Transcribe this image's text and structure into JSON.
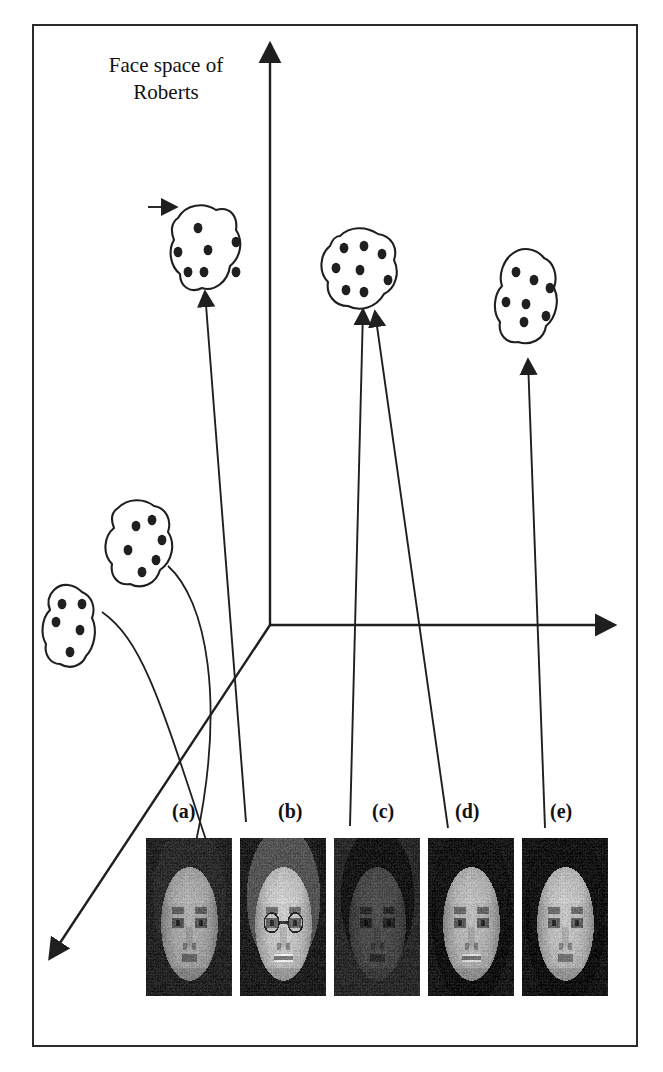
{
  "figure": {
    "title": "Face space of\nRoberts",
    "title_line1": "Face space of",
    "title_line2": "Roberts",
    "border_color": "#2a2a2a",
    "ink_color": "#1f1f1f",
    "background": "#ffffff"
  },
  "axes": {
    "origin": [
      270,
      625
    ],
    "items": [
      {
        "name": "vertical-axis",
        "from": [
          270,
          625
        ],
        "to": [
          270,
          44
        ],
        "arrow": "up"
      },
      {
        "name": "horizontal-axis",
        "from": [
          270,
          625
        ],
        "to": [
          614,
          625
        ],
        "arrow": "right"
      },
      {
        "name": "depth-axis",
        "from": [
          270,
          625
        ],
        "to": [
          50,
          958
        ],
        "arrow": "down-left"
      }
    ]
  },
  "clusters": [
    {
      "id": "cluster-1",
      "name": "cluster-top-left",
      "dots": 7,
      "cx": 198,
      "cy": 250,
      "path": "M178,218 C186,204 204,202 216,210 C230,206 238,216 236,230 C244,242 240,258 230,266 C228,282 214,292 202,288 C190,294 180,286 180,274 C170,266 168,250 174,240 C170,230 172,222 178,218 Z",
      "dot_positions": [
        [
          198,
          228
        ],
        [
          178,
          252
        ],
        [
          208,
          250
        ],
        [
          236,
          242
        ],
        [
          188,
          272
        ],
        [
          204,
          272
        ],
        [
          236,
          272
        ]
      ]
    },
    {
      "id": "cluster-2",
      "name": "cluster-top-middle",
      "dots": 8,
      "cx": 358,
      "cy": 283,
      "path": "M340,236 C350,226 366,226 378,234 C392,236 398,248 394,260 C400,272 396,288 384,294 C376,308 360,312 348,306 C334,306 326,294 328,282 C318,272 320,254 330,246 C332,240 336,236 340,236 Z",
      "dot_positions": [
        [
          344,
          248
        ],
        [
          364,
          246
        ],
        [
          382,
          254
        ],
        [
          336,
          268
        ],
        [
          360,
          270
        ],
        [
          388,
          280
        ],
        [
          346,
          290
        ],
        [
          364,
          292
        ]
      ]
    },
    {
      "id": "cluster-3",
      "name": "cluster-top-right",
      "dots": 7,
      "cx": 524,
      "cy": 295,
      "path": "M512,254 C522,246 536,248 544,258 C554,262 558,276 554,288 C560,300 556,318 546,326 C544,340 530,346 518,342 C506,344 498,334 500,322 C492,312 494,294 502,286 C498,274 504,260 512,254 Z",
      "dot_positions": [
        [
          516,
          272
        ],
        [
          534,
          280
        ],
        [
          550,
          288
        ],
        [
          506,
          302
        ],
        [
          526,
          304
        ],
        [
          546,
          316
        ],
        [
          524,
          322
        ]
      ]
    },
    {
      "id": "cluster-4",
      "name": "cluster-left-upper",
      "dots": 6,
      "cx": 134,
      "cy": 546,
      "path": "M118,508 C128,498 144,498 154,506 C166,508 172,520 168,532 C176,544 172,562 160,570 C156,584 142,590 130,584 C118,586 110,576 112,564 C102,554 104,536 114,528 C110,518 112,512 118,508 Z",
      "dot_positions": [
        [
          136,
          526
        ],
        [
          152,
          520
        ],
        [
          162,
          540
        ],
        [
          128,
          550
        ],
        [
          156,
          560
        ],
        [
          142,
          572
        ]
      ]
    },
    {
      "id": "cluster-5",
      "name": "cluster-left-lower",
      "dots": 5,
      "cx": 68,
      "cy": 625,
      "path": "M54,590 C62,582 74,584 82,592 C92,596 96,608 92,618 C98,630 94,648 86,656 C82,666 70,670 60,664 C50,664 44,654 46,644 C40,634 42,618 50,610 C46,600 50,594 54,590 Z",
      "dot_positions": [
        [
          62,
          604
        ],
        [
          82,
          604
        ],
        [
          56,
          622
        ],
        [
          80,
          630
        ],
        [
          70,
          652
        ]
      ]
    }
  ],
  "links": [
    {
      "name": "arrow-b-to-cluster1",
      "type": "arrow",
      "path": "M246,822 L205,292",
      "arrow_at": [
        205,
        292
      ]
    },
    {
      "name": "arrow-c-to-cluster2",
      "type": "arrow",
      "path": "M350,826 L363,310",
      "arrow_at": [
        363,
        310
      ]
    },
    {
      "name": "arrow-d-to-cluster3",
      "type": "arrow",
      "path": "M448,828 L375,312",
      "arrow_at": [
        375,
        312
      ]
    },
    {
      "name": "arrow-e-to-cluster3b",
      "type": "arrow",
      "path": "M545,828 L528,360",
      "arrow_at": [
        528,
        360
      ]
    },
    {
      "name": "pointer-into-cluster1",
      "type": "arrow",
      "path": "M148,207 L176,207",
      "arrow_at": [
        176,
        207
      ]
    },
    {
      "name": "curve-cluster4-to-face-a",
      "type": "curve",
      "path": "M168,566 C206,600 226,700 196,842"
    },
    {
      "name": "curve-cluster5-to-depth-axis",
      "type": "curve",
      "path": "M102,612 C142,640 160,700 206,840"
    }
  ],
  "face_labels": [
    {
      "key": "a",
      "label": "(a)",
      "x": 172,
      "y": 800
    },
    {
      "key": "b",
      "label": "(b)",
      "x": 278,
      "y": 800
    },
    {
      "key": "c",
      "label": "(c)",
      "x": 372,
      "y": 800
    },
    {
      "key": "d",
      "label": "(d)",
      "x": 455,
      "y": 800
    },
    {
      "key": "e",
      "label": "(e)",
      "x": 550,
      "y": 800
    }
  ],
  "faces": [
    {
      "key": "a",
      "name": "face-photo-a",
      "x": 146,
      "y": 838,
      "w": 86,
      "h": 158,
      "desc": "young man, short dark hair, neutral expression",
      "tone": 128,
      "hair": "#2b2b2b",
      "skin": "#9a9186",
      "bg": "#232323",
      "smile": 0,
      "glasses": 0,
      "longhair": 0
    },
    {
      "key": "b",
      "name": "face-photo-b",
      "x": 240,
      "y": 838,
      "w": 86,
      "h": 158,
      "desc": "middle-aged man with glasses, smiling",
      "tone": 150,
      "hair": "#5a5248",
      "skin": "#b4aa9c",
      "bg": "#1e1e1e",
      "smile": 1,
      "glasses": 1,
      "longhair": 0
    },
    {
      "key": "c",
      "name": "face-photo-c",
      "x": 334,
      "y": 838,
      "w": 86,
      "h": 158,
      "desc": "dark-skinned man, short hair, neutral",
      "tone": 74,
      "hair": "#161616",
      "skin": "#4a4038",
      "bg": "#2a2a2a",
      "smile": 0,
      "glasses": 0,
      "longhair": 0
    },
    {
      "key": "d",
      "name": "face-photo-d",
      "x": 428,
      "y": 838,
      "w": 86,
      "h": 158,
      "desc": "woman with dark hair, slight smile",
      "tone": 120,
      "hair": "#151515",
      "skin": "#a89c8e",
      "bg": "#1a1a1a",
      "smile": 1,
      "glasses": 0,
      "longhair": 1
    },
    {
      "key": "e",
      "name": "face-photo-e",
      "x": 522,
      "y": 838,
      "w": 86,
      "h": 158,
      "desc": "woman with long dark hair, neutral",
      "tone": 132,
      "hair": "#141414",
      "skin": "#b0a496",
      "bg": "#171717",
      "smile": 0,
      "glasses": 0,
      "longhair": 1
    }
  ]
}
